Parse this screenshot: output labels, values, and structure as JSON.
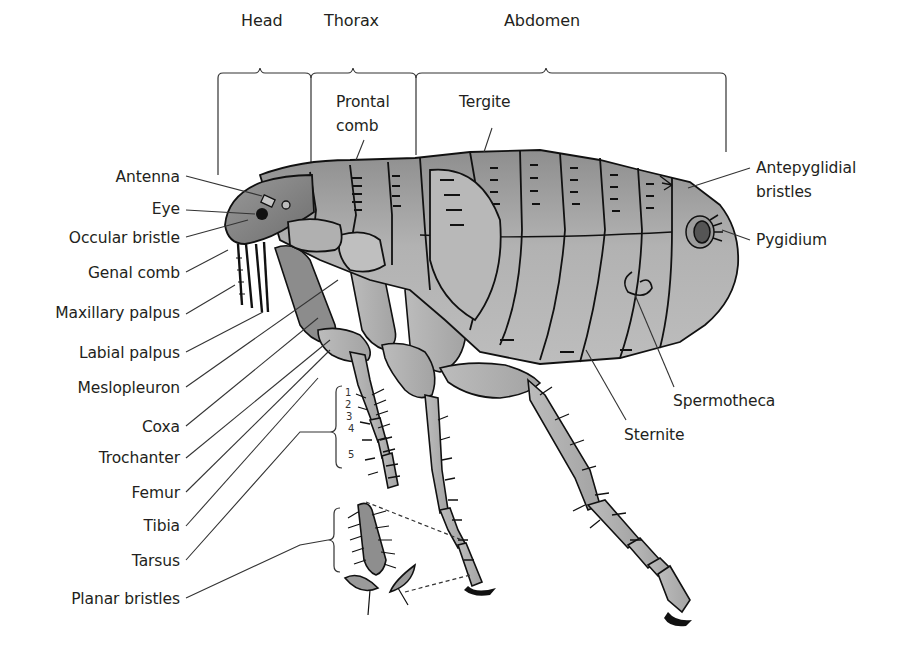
{
  "diagram": {
    "sections": [
      {
        "id": "head",
        "label": "Head"
      },
      {
        "id": "thorax",
        "label": "Thorax"
      },
      {
        "id": "abdomen",
        "label": "Abdomen"
      }
    ],
    "left_labels": [
      {
        "id": "antenna",
        "label": "Antenna"
      },
      {
        "id": "eye",
        "label": "Eye"
      },
      {
        "id": "occular-bristle",
        "label": "Occular bristle"
      },
      {
        "id": "genal-comb",
        "label": "Genal comb"
      },
      {
        "id": "maxillary-palpus",
        "label": "Maxillary palpus"
      },
      {
        "id": "labial-palpus",
        "label": "Labial palpus"
      },
      {
        "id": "meslopleuron",
        "label": "Meslopleuron"
      },
      {
        "id": "coxa",
        "label": "Coxa"
      },
      {
        "id": "trochanter",
        "label": "Trochanter"
      },
      {
        "id": "femur",
        "label": "Femur"
      },
      {
        "id": "tibia",
        "label": "Tibia"
      },
      {
        "id": "tarsus",
        "label": "Tarsus"
      },
      {
        "id": "planar-bristles",
        "label": "Planar bristles"
      }
    ],
    "top_labels": [
      {
        "id": "prontal-comb",
        "label_line1": "Prontal",
        "label_line2": "comb"
      },
      {
        "id": "tergite",
        "label": "Tergite"
      }
    ],
    "right_labels": [
      {
        "id": "antepyglidial-bristles",
        "label_line1": "Antepyglidial",
        "label_line2": "bristles"
      },
      {
        "id": "pygidium",
        "label": "Pygidium"
      },
      {
        "id": "spermotheca",
        "label": "Spermotheca"
      },
      {
        "id": "sternite",
        "label": "Sternite"
      }
    ],
    "tarsal_segments": [
      "1",
      "2",
      "3",
      "4",
      "5"
    ],
    "colors": {
      "body_fill": "#a9a9a9",
      "body_dark": "#6f6f6f",
      "leg_fill": "#b4b4b4",
      "outline": "#111111",
      "leader_line": "#333333",
      "text": "#231f20"
    }
  }
}
